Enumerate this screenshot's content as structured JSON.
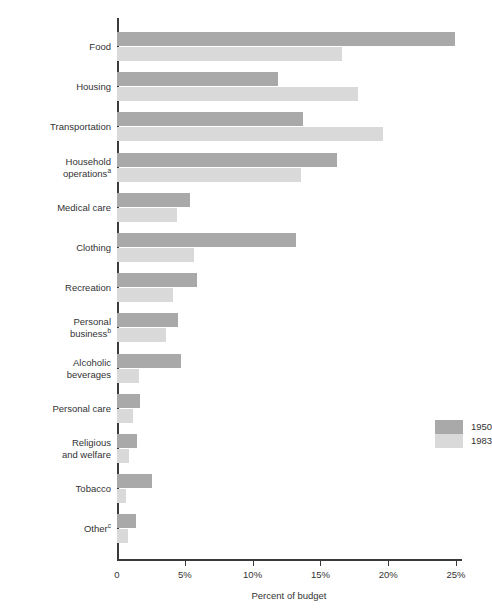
{
  "chart_data": {
    "type": "bar",
    "orientation": "horizontal",
    "title": "",
    "xlabel": "Percent of budget",
    "ylabel": "Expenditure item",
    "xlim": [
      0,
      25
    ],
    "xticks": [
      0,
      5,
      10,
      15,
      20,
      25
    ],
    "xtick_labels": [
      "0",
      "5%",
      "10%",
      "15%",
      "20%",
      "25%"
    ],
    "grid": false,
    "legend_position": "center-right",
    "categories": [
      "Food",
      "Housing",
      "Transportation",
      "Household operations",
      "Medical care",
      "Clothing",
      "Recreation",
      "Personal business",
      "Alcoholic beverages",
      "Personal care",
      "Religious and welfare",
      "Tobacco",
      "Other"
    ],
    "category_labels": [
      {
        "line1": "Food",
        "line2": "",
        "sup": ""
      },
      {
        "line1": "Housing",
        "line2": "",
        "sup": ""
      },
      {
        "line1": "Transportation",
        "line2": "",
        "sup": ""
      },
      {
        "line1": "Household",
        "line2": "operations",
        "sup": "a"
      },
      {
        "line1": "Medical care",
        "line2": "",
        "sup": ""
      },
      {
        "line1": "Clothing",
        "line2": "",
        "sup": ""
      },
      {
        "line1": "Recreation",
        "line2": "",
        "sup": ""
      },
      {
        "line1": "Personal",
        "line2": "business",
        "sup": "b"
      },
      {
        "line1": "Alcoholic",
        "line2": "beverages",
        "sup": ""
      },
      {
        "line1": "Personal care",
        "line2": "",
        "sup": ""
      },
      {
        "line1": "Religious",
        "line2": "and welfare",
        "sup": ""
      },
      {
        "line1": "Tobacco",
        "line2": "",
        "sup": ""
      },
      {
        "line1": "Other",
        "line2": "",
        "sup": "c"
      }
    ],
    "series": [
      {
        "name": "1950",
        "color": "#a9a9a9",
        "values": [
          24.9,
          11.9,
          13.7,
          16.2,
          5.4,
          13.2,
          5.9,
          4.5,
          4.7,
          1.7,
          1.5,
          2.6,
          1.4
        ]
      },
      {
        "name": "1983",
        "color": "#d9d9d9",
        "values": [
          16.6,
          17.8,
          19.6,
          13.6,
          4.4,
          5.7,
          4.1,
          3.6,
          1.6,
          1.2,
          0.9,
          0.7,
          0.8
        ]
      }
    ]
  },
  "legend": {
    "items": [
      {
        "label": "1950",
        "color": "#a9a9a9"
      },
      {
        "label": "1983",
        "color": "#d9d9d9"
      }
    ]
  }
}
